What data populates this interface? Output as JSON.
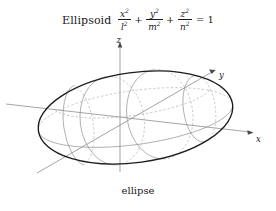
{
  "figure": {
    "title_word": "Ellipsoid",
    "equation": {
      "terms": [
        {
          "num": "x",
          "num_exp": "2",
          "den": "l",
          "den_exp": "2"
        },
        {
          "num": "y",
          "num_exp": "2",
          "den": "m",
          "den_exp": "2"
        },
        {
          "num": "z",
          "num_exp": "2",
          "den": "n",
          "den_exp": "2"
        }
      ],
      "plus_1": "+",
      "plus_2": "+",
      "equals": "= 1"
    },
    "caption": "ellipse",
    "axes": [
      {
        "name": "z-axis",
        "label": "z"
      },
      {
        "name": "y-axis",
        "label": "y"
      },
      {
        "name": "x-axis",
        "label": "x"
      }
    ],
    "colors": {
      "background": "#ffffff",
      "outline": "#1c1c1c",
      "meridian": "#8e8e8e",
      "hidden_meridian": "#a9a9a9",
      "axis": "#7d7d7d",
      "text": "#1a1a1a"
    }
  }
}
